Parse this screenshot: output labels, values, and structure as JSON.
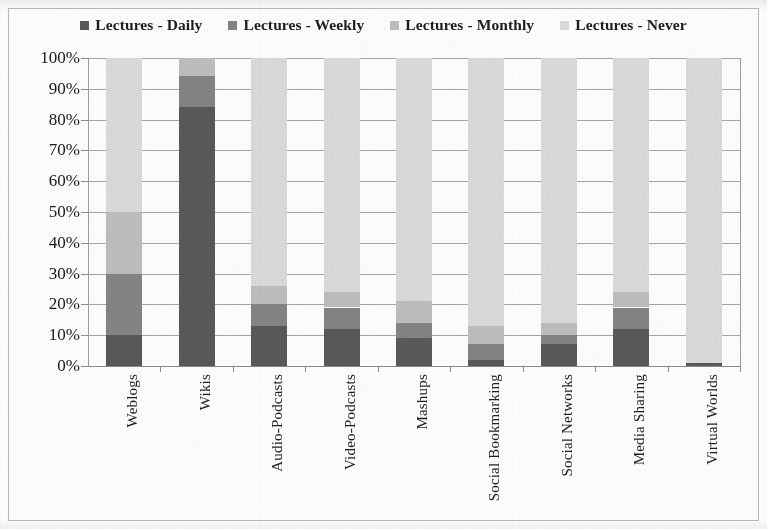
{
  "chart_data": {
    "type": "bar",
    "subtype": "stacked-100-percent",
    "title": "",
    "xlabel": "",
    "ylabel": "",
    "ylim": [
      0,
      100
    ],
    "y_tick_labels": [
      "100%",
      "90%",
      "80%",
      "70%",
      "60%",
      "50%",
      "40%",
      "30%",
      "20%",
      "10%",
      "0%"
    ],
    "y_tick_values": [
      100,
      90,
      80,
      70,
      60,
      50,
      40,
      30,
      20,
      10,
      0
    ],
    "grid": true,
    "legend_position": "top",
    "categories": [
      "Weblogs",
      "Wikis",
      "Audio-Podcasts",
      "Video-Podcasts",
      "Mashups",
      "Social Bookmarking",
      "Social Networks",
      "Media Sharing",
      "Virtual Worlds"
    ],
    "series": [
      {
        "name": "Lectures - Daily",
        "color": "#595959",
        "values": [
          10,
          84,
          13,
          12,
          9,
          2,
          7,
          12,
          1
        ]
      },
      {
        "name": "Lectures - Weekly",
        "color": "#848484",
        "values": [
          20,
          10,
          7,
          7,
          5,
          5,
          3,
          7,
          0
        ]
      },
      {
        "name": "Lectures - Monthly",
        "color": "#bdbdbd",
        "values": [
          20,
          6,
          6,
          5,
          7,
          6,
          4,
          5,
          0
        ]
      },
      {
        "name": "Lectures - Never",
        "color": "#dadada",
        "values": [
          50,
          0,
          74,
          76,
          79,
          87,
          86,
          76,
          99
        ]
      }
    ]
  },
  "legend": {
    "items": [
      {
        "label": "Lectures - Daily",
        "color": "#595959"
      },
      {
        "label": "Lectures - Weekly",
        "color": "#848484"
      },
      {
        "label": "Lectures - Monthly",
        "color": "#bdbdbd"
      },
      {
        "label": "Lectures - Never",
        "color": "#dadada"
      }
    ]
  },
  "colors": {
    "daily": "#595959",
    "weekly": "#848484",
    "monthly": "#bdbdbd",
    "never": "#dadada",
    "gridline": "#a6a6a6",
    "frame": "#b9b9b9",
    "text": "#1a1a1a",
    "background": "#fdfdfd"
  }
}
